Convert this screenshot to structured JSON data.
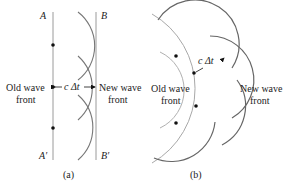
{
  "panel_a": {
    "caption": "(a)",
    "label_A": "A",
    "label_B": "B",
    "label_A_prime": "A′",
    "label_B_prime": "B′",
    "old_front_line1": "Old wave",
    "old_front_line2": "front",
    "new_front_line1": "New wave",
    "new_front_line2": "front",
    "distance_label": "c Δt"
  },
  "panel_b": {
    "caption": "(b)",
    "old_front_line1": "Old wave",
    "old_front_line2": "front",
    "new_front_line1": "New wave",
    "new_front_line2": "front",
    "distance_label": "c Δt"
  },
  "colors": {
    "wavefront_old": "#9a9a9a",
    "wavefront_new": "#8a8a8a",
    "wavelet": "#777777",
    "dot": "#111111",
    "text": "#222222"
  }
}
